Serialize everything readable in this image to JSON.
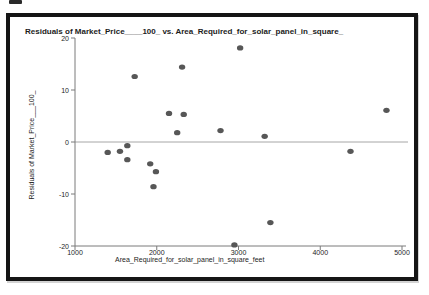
{
  "chart_data": {
    "type": "scatter",
    "title": "Residuals of Market_Price____100_ vs. Area_Required_for_solar_panel_in_square_",
    "xlabel": "Area_Required_for_solar_panel_in_square_feet",
    "ylabel": "Residuals of Market_Price___100_",
    "xlim": [
      1000,
      5000
    ],
    "ylim": [
      -20,
      20
    ],
    "xticks": [
      1000,
      2000,
      3000,
      4000,
      5000
    ],
    "yticks": [
      20,
      10,
      0,
      -10,
      -20
    ],
    "grid": false,
    "legend": "none",
    "reference_line_y": 0,
    "points": [
      {
        "x": 1400,
        "y": -2.0
      },
      {
        "x": 1550,
        "y": -1.8
      },
      {
        "x": 1640,
        "y": -0.7
      },
      {
        "x": 1640,
        "y": -3.4
      },
      {
        "x": 1730,
        "y": 12.6
      },
      {
        "x": 1920,
        "y": -4.2
      },
      {
        "x": 1960,
        "y": -8.6
      },
      {
        "x": 1990,
        "y": -5.7
      },
      {
        "x": 2150,
        "y": 5.5
      },
      {
        "x": 2250,
        "y": 1.8
      },
      {
        "x": 2310,
        "y": 14.4
      },
      {
        "x": 2330,
        "y": 5.3
      },
      {
        "x": 2780,
        "y": 2.2
      },
      {
        "x": 2950,
        "y": -19.8
      },
      {
        "x": 3020,
        "y": 18.1
      },
      {
        "x": 3320,
        "y": 1.1
      },
      {
        "x": 3390,
        "y": -15.5
      },
      {
        "x": 4370,
        "y": -1.8
      },
      {
        "x": 4810,
        "y": 6.1
      }
    ],
    "colors": {
      "point": "#575757",
      "reference_line": "#a6a6a6",
      "axis": "#7a7a7a",
      "text": "#1c1c1c",
      "frame_border": "#151515",
      "background": "#ffffff"
    }
  }
}
